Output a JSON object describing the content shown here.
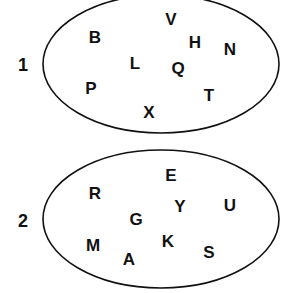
{
  "diagram": {
    "colors": {
      "stroke": "#111111",
      "text": "#111111",
      "background": "#ffffff"
    },
    "sets": [
      {
        "label": "1",
        "label_pos": [
          23,
          65
        ],
        "ellipse": {
          "cx": 161,
          "cy": 64,
          "rx": 118,
          "ry": 69
        },
        "letters": [
          {
            "char": "B",
            "x": 95,
            "y": 37
          },
          {
            "char": "V",
            "x": 171,
            "y": 19
          },
          {
            "char": "H",
            "x": 195,
            "y": 42
          },
          {
            "char": "N",
            "x": 230,
            "y": 49
          },
          {
            "char": "L",
            "x": 135,
            "y": 63
          },
          {
            "char": "Q",
            "x": 178,
            "y": 68
          },
          {
            "char": "P",
            "x": 91,
            "y": 88
          },
          {
            "char": "T",
            "x": 209,
            "y": 95
          },
          {
            "char": "X",
            "x": 149,
            "y": 112
          }
        ]
      },
      {
        "label": "2",
        "label_pos": [
          23,
          221
        ],
        "ellipse": {
          "cx": 161,
          "cy": 219,
          "rx": 118,
          "ry": 69
        },
        "letters": [
          {
            "char": "E",
            "x": 171,
            "y": 175
          },
          {
            "char": "R",
            "x": 95,
            "y": 193
          },
          {
            "char": "Y",
            "x": 180,
            "y": 206
          },
          {
            "char": "U",
            "x": 230,
            "y": 205
          },
          {
            "char": "G",
            "x": 136,
            "y": 219
          },
          {
            "char": "M",
            "x": 93,
            "y": 245
          },
          {
            "char": "K",
            "x": 168,
            "y": 241
          },
          {
            "char": "S",
            "x": 209,
            "y": 252
          },
          {
            "char": "A",
            "x": 129,
            "y": 259
          }
        ]
      }
    ]
  }
}
